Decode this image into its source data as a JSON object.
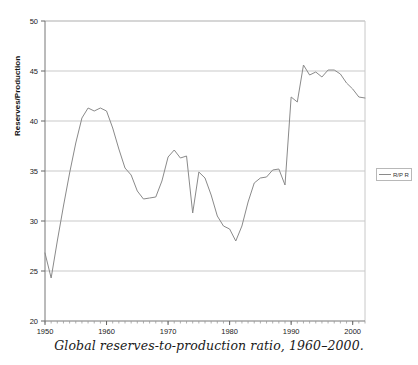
{
  "figure": {
    "caption": "Global reserves-to-production ratio, 1960–2000.",
    "ylabel": "Reserves/Production",
    "legend_label": "R/P R"
  },
  "chart_data": {
    "type": "line",
    "title": "",
    "subtitle": "",
    "xlabel": "",
    "ylabel": "Reserves/Production",
    "xlim": [
      1950,
      2002
    ],
    "ylim": [
      20,
      50
    ],
    "ytick_labels": [
      "20",
      "25",
      "30",
      "35",
      "40",
      "45",
      "50"
    ],
    "yticks": [
      20,
      25,
      30,
      35,
      40,
      45,
      50
    ],
    "xtick_labels": [
      "1950",
      "1960",
      "1970",
      "1980",
      "1990",
      "2000"
    ],
    "xticks": [
      1950,
      1960,
      1970,
      1980,
      1990,
      2000
    ],
    "minor_xtick_interval": 1,
    "grid": "horizontal",
    "legend_position": "right-outside",
    "legend": [
      "R/P R"
    ],
    "series": [
      {
        "name": "R/P R",
        "color": "#8a8a8a",
        "x": [
          1950,
          1951,
          1952,
          1953,
          1954,
          1955,
          1956,
          1957,
          1958,
          1959,
          1960,
          1961,
          1962,
          1963,
          1964,
          1965,
          1966,
          1967,
          1968,
          1969,
          1970,
          1971,
          1972,
          1973,
          1974,
          1975,
          1976,
          1977,
          1978,
          1979,
          1980,
          1981,
          1982,
          1983,
          1984,
          1985,
          1986,
          1987,
          1988,
          1989,
          1990,
          1991,
          1992,
          1993,
          1994,
          1995,
          1996,
          1997,
          1998,
          1999,
          2000,
          2001,
          2002
        ],
        "values": [
          26.8,
          24.3,
          28.0,
          31.5,
          34.8,
          37.8,
          40.3,
          41.3,
          41.0,
          41.3,
          41.0,
          39.3,
          37.2,
          35.3,
          34.6,
          33.0,
          32.2,
          32.3,
          32.4,
          34.0,
          36.4,
          37.1,
          36.3,
          36.5,
          30.8,
          34.9,
          34.3,
          32.6,
          30.5,
          29.5,
          29.2,
          28.0,
          29.5,
          31.9,
          33.8,
          34.3,
          34.4,
          35.1,
          35.2,
          33.6,
          42.4,
          41.9,
          45.6,
          44.6,
          44.9,
          44.4,
          45.1,
          45.1,
          44.7,
          43.8,
          43.2,
          42.4,
          42.3
        ]
      }
    ],
    "annotations": []
  }
}
